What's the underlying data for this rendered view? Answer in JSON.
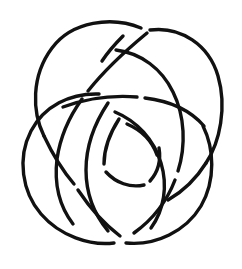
{
  "figure": {
    "kind": "line-drawing",
    "background_color": "#ffffff",
    "stroke_color": "#111111",
    "stroke_width": 3.4,
    "canvas": {
      "width": 242,
      "height": 269
    },
    "symmetry": "approximate 3-fold rotational",
    "crossing_count": 9,
    "loop_count": 3
  },
  "chart_data": {
    "type": "line",
    "xlabel": "",
    "ylabel": "",
    "xlim": [
      0,
      242
    ],
    "ylim": [
      0,
      269
    ],
    "grid": false,
    "legend": "none",
    "series": [
      {
        "name": "outer-loop-upper-left",
        "stroke": "#111111",
        "path": "M 141 28 C 112 16, 72 21, 52 48 C 31 76, 32 112, 44 136"
      },
      {
        "name": "outer-loop-upper-left-lower-tail",
        "stroke": "#111111",
        "path": "M 44 136 C 52 153, 62 170, 74 184"
      },
      {
        "name": "outer-loop-upper-right",
        "stroke": "#111111",
        "path": "M 150 30 C 181 26, 209 45, 218 76 C 227 107, 220 142, 206 163"
      },
      {
        "name": "outer-loop-upper-right-lower-tail",
        "stroke": "#111111",
        "path": "M 206 163 C 196 179, 182 192, 168 200"
      },
      {
        "name": "outer-loop-left-lower",
        "stroke": "#111111",
        "path": "M 99 94 C 70 93, 44 106, 31 131 C 17 158, 22 192, 41 214 C 60 236, 90 246, 114 243"
      },
      {
        "name": "outer-loop-bottom-right",
        "stroke": "#111111",
        "path": "M 126 243 C 156 246, 186 231, 201 206 C 216 180, 214 148, 203 126"
      },
      {
        "name": "inner-arc-upper-left-spiral",
        "stroke": "#111111",
        "path": "M 147 33 C 124 52, 103 72, 88 91"
      },
      {
        "name": "inner-arc-upper-left-spiral-2",
        "stroke": "#111111",
        "path": "M 82 99 C 69 117, 60 138, 57 159 C 54 184, 60 207, 73 224"
      },
      {
        "name": "inner-arc-right-descend",
        "stroke": "#111111",
        "path": "M 116 50 C 141 53, 162 69, 173 92 C 185 116, 186 146, 178 171"
      },
      {
        "name": "inner-arc-right-descend-2",
        "stroke": "#111111",
        "path": "M 175 180 C 167 201, 152 220, 134 233"
      },
      {
        "name": "inner-arc-mid-horizontal-left",
        "stroke": "#111111",
        "path": "M 63 107 C 85 99, 112 95, 137 97"
      },
      {
        "name": "inner-arc-mid-horizontal-right",
        "stroke": "#111111",
        "path": "M 145 98 C 170 101, 191 111, 204 126"
      },
      {
        "name": "inner-arc-center-left",
        "stroke": "#111111",
        "path": "M 108 103 C 94 124, 86 148, 86 170 C 86 192, 94 214, 108 231"
      },
      {
        "name": "inner-arc-center-right",
        "stroke": "#111111",
        "path": "M 115 112 C 137 121, 154 140, 161 163 C 168 186, 164 210, 151 228"
      },
      {
        "name": "inner-core-left",
        "stroke": "#111111",
        "path": "M 119 119 C 110 133, 104 150, 104 164"
      },
      {
        "name": "inner-core-bottom",
        "stroke": "#111111",
        "path": "M 106 172 C 116 183, 130 188, 144 185"
      },
      {
        "name": "inner-core-right",
        "stroke": "#111111",
        "path": "M 150 181 C 158 172, 161 160, 159 148"
      },
      {
        "name": "inner-core-small-arc",
        "stroke": "#111111",
        "path": "M 127 124 C 141 130, 152 141, 157 155"
      },
      {
        "name": "bottom-left-connector",
        "stroke": "#111111",
        "path": "M 78 190 C 90 208, 104 224, 120 236"
      },
      {
        "name": "upper-center-wedge",
        "stroke": "#111111",
        "path": "M 123 36 C 115 44, 108 52, 102 61"
      }
    ]
  }
}
